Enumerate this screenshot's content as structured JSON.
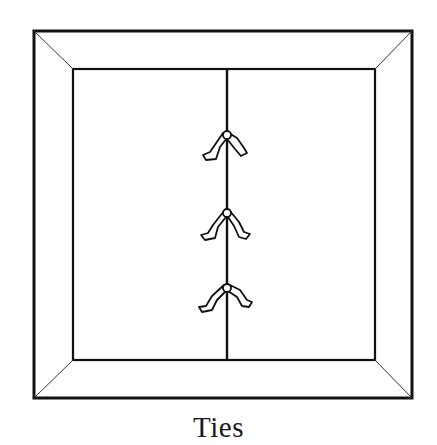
{
  "figure": {
    "caption": "Ties"
  },
  "frame": {
    "outer": {
      "x1": 34,
      "y1": 31,
      "x2": 412,
      "y2": 398
    },
    "inner": {
      "x1": 73,
      "y1": 69,
      "x2": 375,
      "y2": 360
    },
    "stroke_color": "#111111"
  },
  "seam": {
    "x": 227,
    "y1": 69,
    "y2": 360
  },
  "ties": [
    {
      "label": "tie-1",
      "knot_y": 135
    },
    {
      "label": "tie-2",
      "knot_y": 213
    },
    {
      "label": "tie-3",
      "knot_y": 288
    }
  ]
}
